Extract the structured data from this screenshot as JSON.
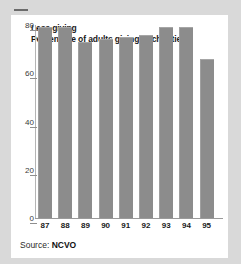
{
  "chart_data": {
    "type": "bar",
    "title": "Less giving",
    "subtitle": "Percentage of adults giving to charities",
    "categories": [
      "87",
      "88",
      "89",
      "90",
      "91",
      "92",
      "93",
      "94",
      "95"
    ],
    "values": [
      79,
      79,
      73,
      74,
      75,
      76,
      79,
      79,
      66
    ],
    "xlabel": "",
    "ylabel": "",
    "ylim": [
      0,
      80
    ],
    "yticks": [
      0,
      20,
      40,
      60,
      80
    ],
    "ytick_labels": [
      "0",
      "20",
      "40",
      "60",
      "80"
    ],
    "grid": false,
    "legend": null,
    "bar_color": "#8c8c8c",
    "panel_color": "#ffffff",
    "background_color": "#d9d9d9"
  },
  "source": {
    "label": "Source:",
    "value": "NCVO"
  }
}
